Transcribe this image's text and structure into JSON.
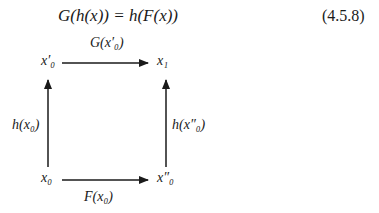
{
  "equation": {
    "text": "G(h(x)) = h(F(x))",
    "number": "(4.5.8)"
  },
  "diagram": {
    "nodes": {
      "top_left": "x′₀",
      "top_right": "x₁",
      "bottom_left": "x₀",
      "bottom_right": "x″₀"
    },
    "arrows": {
      "top": "G(x′₀)",
      "bottom": "F(x₀)",
      "left": "h(x₀)",
      "right": "h(x″₀)"
    }
  }
}
